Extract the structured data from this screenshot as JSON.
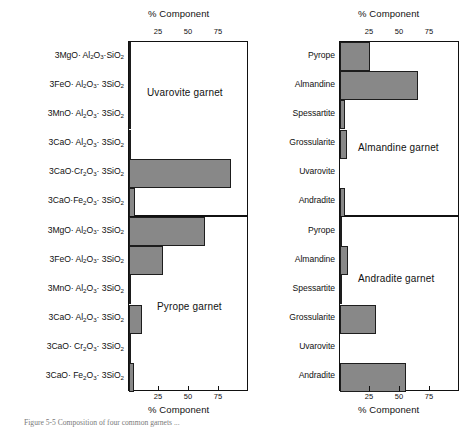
{
  "figure": {
    "caption": "Figure 5-5 Composition of four common garnets ...",
    "axis_title": "% Component",
    "bar_color": "#888888",
    "bar_edge_color": "#1d1d1d",
    "axis_color": "#111111"
  },
  "left_column": {
    "axis_title_top": "% Component",
    "axis_title_bottom": "% Component",
    "tick_labels": [
      "25",
      "50",
      "75"
    ],
    "categories": [
      "3MgO· Al2O3·SiO2",
      "3FeO· Al2O3· 3SiO2",
      "3MnO· Al2O3· 3SiO2",
      "3CaO· Al2O3· 3SiO2",
      "3CaO·Cr2O3· 3SiO2",
      "3CaO·Fe2O3· 3SiO2"
    ],
    "categories_lower": [
      "3MgO· Al2O3· 3SiO2",
      "3FeO· Al2O3· 3SiO2",
      "3MnO· Al2O3· 3SiO2",
      "3CaO· Al2O3· 3SiO2",
      "3CaO· Cr2O3· 3SiO2",
      "3CaO· Fe2O3· 3SiO2"
    ]
  },
  "right_column": {
    "axis_title_top": "% Component",
    "axis_title_bottom": "% Component",
    "tick_labels": [
      "25",
      "50",
      "75"
    ],
    "categories": [
      "Pyrope",
      "Almandine",
      "Spessartite",
      "Grossularite",
      "Uvarovite",
      "Andradite"
    ]
  },
  "panels": {
    "uvarovite": {
      "label": "Uvarovite garnet"
    },
    "pyrope": {
      "label": "Pyrope garnet"
    },
    "almandine": {
      "label": "Almandine garnet"
    },
    "andradite": {
      "label": "Andradite garnet"
    }
  },
  "chart_data": [
    {
      "type": "bar",
      "orientation": "horizontal",
      "title": "Uvarovite garnet",
      "xlabel": "% Component",
      "ylabel": "",
      "xlim": [
        0,
        100
      ],
      "xticks": [
        25,
        50,
        75
      ],
      "grid": false,
      "legend": "none",
      "categories": [
        "3MgO·Al2O3·SiO2",
        "3FeO·Al2O3·3SiO2",
        "3MnO·Al2O3·3SiO2",
        "3CaO·Al2O3·3SiO2",
        "3CaO·Cr2O3·3SiO2",
        "3CaO·Fe2O3·3SiO2"
      ],
      "values": [
        1,
        1,
        1,
        2,
        85,
        5
      ]
    },
    {
      "type": "bar",
      "orientation": "horizontal",
      "title": "Pyrope garnet",
      "xlabel": "% Component",
      "ylabel": "",
      "xlim": [
        0,
        100
      ],
      "xticks": [
        25,
        50,
        75
      ],
      "grid": false,
      "legend": "none",
      "categories": [
        "3MgO·Al2O3·3SiO2",
        "3FeO·Al2O3·3SiO2",
        "3MnO·Al2O3·3SiO2",
        "3CaO·Al2O3·3SiO2",
        "3CaO·Cr2O3·3SiO2",
        "3CaO·Fe2O3·3SiO2"
      ],
      "values": [
        63,
        28,
        1,
        11,
        1,
        4
      ]
    },
    {
      "type": "bar",
      "orientation": "horizontal",
      "title": "Almandine garnet",
      "xlabel": "% Component",
      "ylabel": "",
      "xlim": [
        0,
        100
      ],
      "xticks": [
        25,
        50,
        75
      ],
      "grid": false,
      "legend": "none",
      "categories": [
        "Pyrope",
        "Almandine",
        "Spessartite",
        "Grossularite",
        "Uvarovite",
        "Andradite"
      ],
      "values": [
        25,
        65,
        4,
        6,
        0,
        4
      ]
    },
    {
      "type": "bar",
      "orientation": "horizontal",
      "title": "Andradite garnet",
      "xlabel": "% Component",
      "ylabel": "",
      "xlim": [
        0,
        100
      ],
      "xticks": [
        25,
        50,
        75
      ],
      "grid": false,
      "legend": "none",
      "categories": [
        "Pyrope",
        "Almandine",
        "Spessartite",
        "Grossularite",
        "Uvarovite",
        "Andradite"
      ],
      "values": [
        2,
        7,
        2,
        30,
        0,
        55
      ]
    }
  ]
}
